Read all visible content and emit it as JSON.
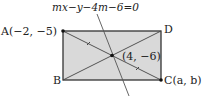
{
  "diagram": {
    "equation": "mx−y−4m−6=0",
    "points": {
      "A": {
        "label": "A(−2, −5)"
      },
      "B": {
        "label": "B"
      },
      "C": {
        "label": "C(a, b)"
      },
      "D": {
        "label": "D"
      },
      "center": {
        "label": "(4, −6)"
      }
    },
    "colors": {
      "fill": "#d9d9d9",
      "stroke": "#333333",
      "line": "#555555"
    }
  }
}
